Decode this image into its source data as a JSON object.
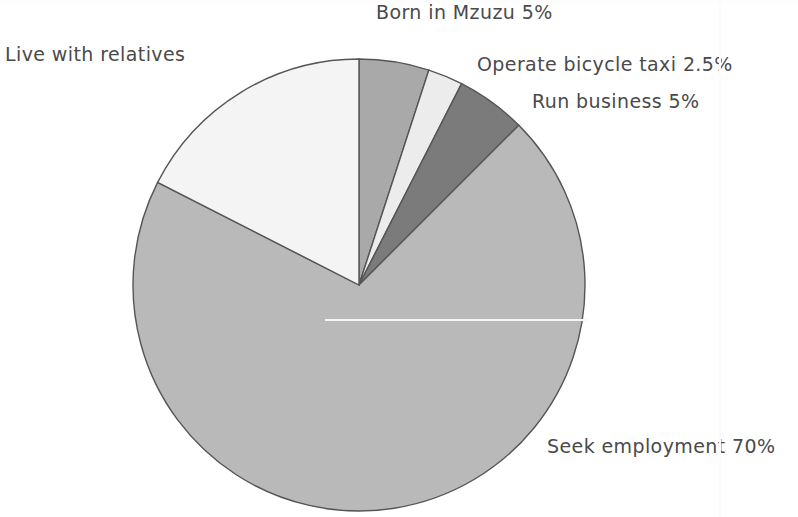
{
  "chart_data": {
    "type": "pie",
    "title": "",
    "subtitle": "",
    "xlabel": "",
    "ylabel": "",
    "legend_position": "none",
    "grid": false,
    "units": "percent",
    "categories": [
      "Born in Mzuzu",
      "Operate bicycle taxi",
      "Run business",
      "Seek employment",
      "Live with relatives"
    ],
    "values": [
      5,
      2.5,
      5,
      70,
      17.5
    ],
    "labels": [
      "Born in Mzuzu 5%",
      "Operate bicycle taxi 2.5%",
      "Run business 5%",
      "Seek employment 70%",
      "Live with relatives"
    ],
    "slices": [
      {
        "name": "Born in Mzuzu",
        "label": "Born in Mzuzu 5%",
        "value": 5,
        "value_text": "5%",
        "color": "#a9a9a9",
        "start_angle": 0,
        "end_angle": 18
      },
      {
        "name": "Operate bicycle taxi",
        "label": "Operate bicycle taxi 2.5%",
        "value": 2.5,
        "value_text": "2.5%",
        "color": "#ececec",
        "start_angle": 18,
        "end_angle": 27
      },
      {
        "name": "Run business",
        "label": "Run business 5%",
        "value": 5,
        "value_text": "5%",
        "color": "#7b7b7b",
        "start_angle": 27,
        "end_angle": 45
      },
      {
        "name": "Seek employment",
        "label": "Seek employment 70%",
        "value": 70,
        "value_text": "70%",
        "color": "#b9b9b9",
        "start_angle": 45,
        "end_angle": 297
      },
      {
        "name": "Live with relatives",
        "label": "Live with relatives",
        "value": 17.5,
        "value_text": "",
        "color": "#f4f4f4",
        "start_angle": 297,
        "end_angle": 360
      }
    ],
    "geometry": {
      "center_x": 359,
      "center_y": 285,
      "radius": 226,
      "outline_color": "#555555",
      "background": "#ffffff"
    }
  }
}
